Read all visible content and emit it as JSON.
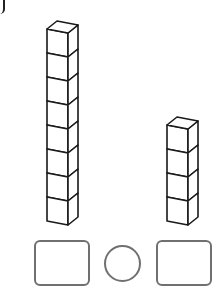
{
  "figure": {
    "colors": {
      "cube_stroke": "#1a1a1a",
      "cube_fill": "#ffffff",
      "answer_stroke": "#707070",
      "background": "#ffffff"
    },
    "towers": [
      {
        "name": "left-tower",
        "cube_count": 8,
        "front_x": 47,
        "top_y": 29
      },
      {
        "name": "right-tower",
        "cube_count": 4,
        "front_x": 167,
        "top_y": 125
      }
    ],
    "cube": {
      "front_width": 21,
      "height": 24,
      "depth_x": 10,
      "depth_y": 8,
      "front_slant": 4
    },
    "answer_row": {
      "left_box": {
        "x": 34,
        "y": 240,
        "w": 56,
        "h": 46,
        "value": ""
      },
      "circle": {
        "cx": 122,
        "cy": 263,
        "d": 37,
        "value": ""
      },
      "right_box": {
        "x": 156,
        "y": 240,
        "w": 56,
        "h": 46,
        "value": ""
      }
    }
  }
}
